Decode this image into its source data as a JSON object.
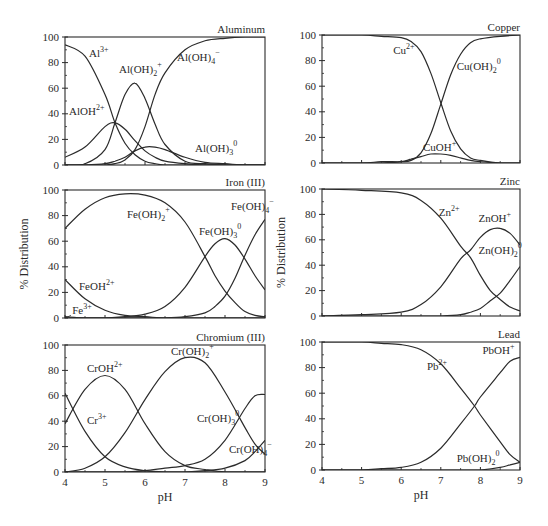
{
  "figure": {
    "ylabel": "% Distribution",
    "xlabel": "pH",
    "line_color": "#2b2b2b",
    "text_color": "#2a2a2a"
  },
  "chart_data": [
    {
      "type": "line",
      "title": "Aluminum",
      "xlabel": "",
      "ylabel": "",
      "xlim": [
        4,
        9
      ],
      "ylim": [
        0,
        100
      ],
      "xticks": [
        4,
        5,
        6,
        7,
        8,
        9
      ],
      "yticks": [
        0,
        20,
        40,
        60,
        80,
        100
      ],
      "show_xtick_labels": false,
      "show_ylabel": false,
      "x": [
        4.0,
        4.5,
        5.0,
        5.25,
        5.5,
        5.75,
        6.0,
        6.25,
        6.5,
        7.0,
        7.5,
        8.0,
        8.5,
        9.0
      ],
      "series": [
        {
          "name": "Al3+",
          "label": "Al",
          "sup": "3+",
          "values": [
            94,
            85,
            55,
            33,
            17,
            8,
            3,
            1,
            0,
            0,
            0,
            0,
            0,
            0
          ],
          "label_pos": [
            4.6,
            84
          ]
        },
        {
          "name": "AlOH2+",
          "label": "AlOH",
          "sup": "2+",
          "values": [
            6,
            14,
            30,
            33,
            28,
            19,
            11,
            6,
            3,
            1,
            0,
            0,
            0,
            0
          ],
          "label_pos": [
            4.1,
            39
          ]
        },
        {
          "name": "Al(OH)2+",
          "label": "Al(OH)",
          "sub": "2",
          "sup": "+",
          "values": [
            0,
            1,
            12,
            33,
            55,
            64,
            52,
            32,
            16,
            3,
            1,
            0,
            0,
            0
          ],
          "label_pos": [
            5.35,
            72
          ]
        },
        {
          "name": "Al(OH)3 0",
          "label": "Al(OH)",
          "sub": "3",
          "sup": "0",
          "values": [
            0,
            0,
            1,
            3,
            6,
            11,
            14,
            14,
            12,
            6,
            2,
            1,
            0,
            0
          ],
          "label_pos": [
            7.25,
            10
          ]
        },
        {
          "name": "Al(OH)4-",
          "label": "Al(OH)",
          "sub": "4",
          "sup": "−",
          "values": [
            0,
            0,
            0,
            1,
            4,
            12,
            30,
            55,
            72,
            90,
            97,
            99,
            100,
            100
          ],
          "label_pos": [
            6.8,
            81
          ]
        }
      ]
    },
    {
      "type": "line",
      "title": "Copper",
      "xlim": [
        4,
        9
      ],
      "ylim": [
        0,
        100
      ],
      "xticks": [
        4,
        5,
        6,
        7,
        8,
        9
      ],
      "yticks": [
        0,
        20,
        40,
        60,
        80,
        100
      ],
      "show_xtick_labels": false,
      "show_ylabel": false,
      "x": [
        4.0,
        5.0,
        5.5,
        6.0,
        6.25,
        6.5,
        6.75,
        7.0,
        7.25,
        7.5,
        7.75,
        8.0,
        8.5,
        9.0
      ],
      "series": [
        {
          "name": "Cu2+",
          "label": "Cu",
          "sup": "2+",
          "values": [
            100,
            100,
            99,
            98,
            95,
            87,
            70,
            47,
            25,
            11,
            4,
            2,
            0,
            0
          ],
          "label_pos": [
            5.8,
            85
          ]
        },
        {
          "name": "CuOH+",
          "label": "CuOH",
          "sup": "+",
          "values": [
            0,
            0,
            0,
            1,
            3,
            5,
            7,
            7,
            6,
            4,
            2,
            1,
            0,
            0
          ],
          "label_pos": [
            6.55,
            9
          ]
        },
        {
          "name": "Cu(OH)2 0",
          "label": "Cu(OH)",
          "sub": "2",
          "sup": "0",
          "values": [
            0,
            0,
            1,
            1,
            2,
            8,
            23,
            46,
            69,
            85,
            94,
            97,
            99,
            100
          ],
          "label_pos": [
            7.4,
            73
          ]
        }
      ]
    },
    {
      "type": "line",
      "title": "Iron (III)",
      "xlim": [
        4,
        9
      ],
      "ylim": [
        0,
        100
      ],
      "xticks": [
        4,
        5,
        6,
        7,
        8,
        9
      ],
      "yticks": [
        0,
        20,
        40,
        60,
        80,
        100
      ],
      "show_xtick_labels": false,
      "show_ylabel": true,
      "x": [
        4.0,
        4.5,
        5.0,
        5.5,
        6.0,
        6.5,
        7.0,
        7.5,
        7.75,
        8.0,
        8.25,
        8.5,
        8.75,
        9.0
      ],
      "series": [
        {
          "name": "Fe3+",
          "label": "Fe",
          "sup": "3+",
          "values": [
            1,
            0,
            0,
            0,
            0,
            0,
            0,
            0,
            0,
            0,
            0,
            0,
            0,
            0
          ],
          "label_pos": [
            4.18,
            3
          ]
        },
        {
          "name": "FeOH2+",
          "label": "FeOH",
          "sup": "2+",
          "values": [
            30,
            15,
            6,
            2,
            1,
            0,
            0,
            0,
            0,
            0,
            0,
            0,
            0,
            0
          ],
          "label_pos": [
            4.35,
            22
          ]
        },
        {
          "name": "Fe(OH)2+",
          "label": "Fe(OH)",
          "sub": "2",
          "sup": "+",
          "values": [
            70,
            85,
            94,
            97,
            96,
            90,
            75,
            48,
            33,
            21,
            12,
            5,
            2,
            1
          ],
          "label_pos": [
            5.55,
            78
          ]
        },
        {
          "name": "Fe(OH)3 0",
          "label": "Fe(OH)",
          "sub": "3",
          "sup": "0",
          "values": [
            0,
            0,
            0,
            1,
            3,
            9,
            24,
            48,
            58,
            62,
            57,
            46,
            33,
            22
          ],
          "label_pos": [
            7.35,
            65
          ]
        },
        {
          "name": "Fe(OH)4-",
          "label": "Fe(OH)",
          "sub": "4",
          "sup": "−",
          "values": [
            0,
            0,
            0,
            0,
            0,
            0,
            1,
            4,
            9,
            17,
            31,
            49,
            65,
            77
          ],
          "label_pos": [
            8.15,
            84
          ]
        }
      ]
    },
    {
      "type": "line",
      "title": "Zinc",
      "xlim": [
        4,
        9
      ],
      "ylim": [
        0,
        100
      ],
      "xticks": [
        4,
        5,
        6,
        7,
        8,
        9
      ],
      "yticks": [
        0,
        20,
        40,
        60,
        80,
        100
      ],
      "show_xtick_labels": false,
      "show_ylabel": true,
      "x": [
        4.0,
        5.0,
        6.0,
        6.5,
        7.0,
        7.5,
        7.75,
        8.0,
        8.25,
        8.5,
        8.75,
        9.0
      ],
      "series": [
        {
          "name": "Zn2+",
          "label": "Zn",
          "sup": "2+",
          "values": [
            100,
            99,
            97,
            91,
            77,
            55,
            46,
            32,
            20,
            13,
            7,
            4
          ],
          "label_pos": [
            6.95,
            79
          ]
        },
        {
          "name": "ZnOH+",
          "label": "ZnOH",
          "sup": "+",
          "values": [
            0,
            1,
            3,
            9,
            23,
            45,
            52,
            62,
            68,
            69,
            65,
            56
          ],
          "label_pos": [
            7.95,
            74
          ]
        },
        {
          "name": "Zn(OH)2 0",
          "label": "Zn(OH)",
          "sub": "2",
          "sup": "0",
          "values": [
            0,
            0,
            0,
            0,
            0,
            1,
            3,
            6,
            12,
            18,
            28,
            39
          ],
          "label_pos": [
            7.95,
            49
          ]
        }
      ]
    },
    {
      "type": "line",
      "title": "Chromium (III)",
      "xlim": [
        4,
        9
      ],
      "ylim": [
        0,
        100
      ],
      "xticks": [
        4,
        5,
        6,
        7,
        8,
        9
      ],
      "yticks": [
        0,
        20,
        40,
        60,
        80,
        100
      ],
      "show_xtick_labels": true,
      "show_ylabel": false,
      "x": [
        4.0,
        4.5,
        5.0,
        5.5,
        6.0,
        6.5,
        7.0,
        7.5,
        8.0,
        8.5,
        8.75,
        9.0
      ],
      "series": [
        {
          "name": "Cr3+",
          "label": "Cr",
          "sup": "3+",
          "values": [
            62,
            32,
            12,
            4,
            1,
            0,
            0,
            0,
            0,
            0,
            0,
            0
          ],
          "label_pos": [
            4.55,
            38
          ]
        },
        {
          "name": "CrOH2+",
          "label": "CrOH",
          "sup": "2+",
          "values": [
            38,
            65,
            76,
            65,
            38,
            16,
            5,
            2,
            0,
            0,
            0,
            0
          ],
          "label_pos": [
            4.55,
            79
          ]
        },
        {
          "name": "Cr(OH)2+",
          "label": "Cr(OH)",
          "sub": "2",
          "sup": "+",
          "values": [
            0,
            3,
            12,
            31,
            57,
            79,
            90,
            86,
            63,
            35,
            22,
            14
          ],
          "label_pos": [
            6.65,
            92
          ]
        },
        {
          "name": "Cr(OH)3 0",
          "label": "Cr(OH)",
          "sub": "3",
          "sup": "0",
          "values": [
            0,
            0,
            0,
            0,
            1,
            3,
            5,
            10,
            25,
            50,
            60,
            61
          ],
          "label_pos": [
            7.3,
            39
          ]
        },
        {
          "name": "Cr(OH)4-",
          "label": "Cr(OH)",
          "sub": "4",
          "sup": "−",
          "values": [
            0,
            0,
            0,
            0,
            0,
            0,
            0,
            1,
            3,
            9,
            16,
            25
          ],
          "label_pos": [
            8.1,
            15
          ]
        }
      ]
    },
    {
      "type": "line",
      "title": "Lead",
      "xlim": [
        4,
        9
      ],
      "ylim": [
        0,
        100
      ],
      "xticks": [
        4,
        5,
        6,
        7,
        8,
        9
      ],
      "yticks": [
        0,
        20,
        40,
        60,
        80,
        100
      ],
      "show_xtick_labels": true,
      "show_ylabel": false,
      "x": [
        4.0,
        5.0,
        5.5,
        6.0,
        6.5,
        7.0,
        7.5,
        7.85,
        8.0,
        8.5,
        8.75,
        9.0
      ],
      "series": [
        {
          "name": "Pb2+",
          "label": "Pb",
          "sup": "2+",
          "values": [
            100,
            100,
            99,
            98,
            94,
            83,
            64,
            50,
            43,
            22,
            12,
            6
          ],
          "label_pos": [
            6.65,
            78
          ]
        },
        {
          "name": "PbOH+",
          "label": "PbOH",
          "sup": "+",
          "values": [
            0,
            0,
            1,
            2,
            6,
            17,
            36,
            50,
            57,
            76,
            85,
            88
          ],
          "label_pos": [
            8.05,
            91
          ]
        },
        {
          "name": "Pb(OH)2 0",
          "label": "Pb(OH)",
          "sub": "2",
          "sup": "0",
          "values": [
            0,
            0,
            0,
            0,
            0,
            0,
            0,
            0,
            0,
            2,
            4,
            6
          ],
          "label_pos": [
            7.4,
            6
          ]
        }
      ]
    }
  ],
  "layout": {
    "panels": [
      {
        "x0": 65,
        "x1": 265,
        "y0": 37,
        "y1": 165
      },
      {
        "x0": 322,
        "x1": 520,
        "y0": 35,
        "y1": 163
      },
      {
        "x0": 65,
        "x1": 265,
        "y0": 190,
        "y1": 318
      },
      {
        "x0": 322,
        "x1": 520,
        "y0": 189,
        "y1": 316
      },
      {
        "x0": 65,
        "x1": 265,
        "y0": 345,
        "y1": 472
      },
      {
        "x0": 322,
        "x1": 520,
        "y0": 342,
        "y1": 470
      }
    ]
  }
}
